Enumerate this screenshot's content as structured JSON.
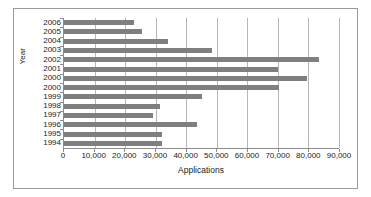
{
  "chart_data": {
    "type": "bar",
    "orientation": "horizontal",
    "title": "",
    "xlabel": "Applications",
    "ylabel": "Year",
    "categories": [
      "2006",
      "2005",
      "2004",
      "2003",
      "2002",
      "2001",
      "2000",
      "2000",
      "1999",
      "1998",
      "1997",
      "1996",
      "1995",
      "1994"
    ],
    "values": [
      23000,
      25500,
      34000,
      48500,
      83500,
      70000,
      79500,
      70500,
      45000,
      31500,
      29000,
      43500,
      32000,
      32000
    ],
    "xlim": [
      0,
      90000
    ],
    "xticks": [
      0,
      10000,
      20000,
      30000,
      40000,
      50000,
      60000,
      70000,
      80000,
      90000
    ],
    "xtick_labels": [
      "0",
      "10,000",
      "20,000",
      "30,000",
      "40,000",
      "50,000",
      "60,000",
      "70,000",
      "80,000",
      "90,000"
    ],
    "grid": "vertical",
    "legend": "none",
    "bar_color": "#7f7f7f",
    "axis_color": "#8c8c8c",
    "gridline_color": "#b6b6b6",
    "frame_color": "#9a9a9a",
    "background": "#ffffff"
  }
}
